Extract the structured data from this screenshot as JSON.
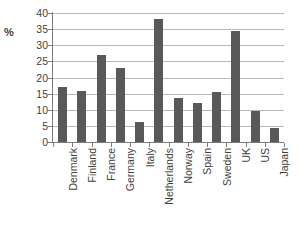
{
  "chart_data": {
    "type": "bar",
    "title": "",
    "subtitle": "",
    "xlabel": "",
    "ylabel": "%",
    "ylim": [
      0,
      40
    ],
    "yticks": [
      0,
      5,
      10,
      15,
      20,
      25,
      30,
      35,
      40
    ],
    "ytick_labels": [
      "0",
      "5",
      "10",
      "15",
      "20",
      "25",
      "30",
      "35",
      "40"
    ],
    "grid": true,
    "grid_axis": "y",
    "legend": false,
    "legend_position": "none",
    "bar_color": "#595959",
    "gridline_color": "#b8b8b8",
    "axis_color": "#7c7c7c",
    "text_color": "#3f3f3f",
    "xtick_label_rotation": 90,
    "categories": [
      "Denmark",
      "Finland",
      "France",
      "Germany",
      "Italy",
      "Netherlands",
      "Norway",
      "Spain",
      "Sweden",
      "UK",
      "US",
      "Japan"
    ],
    "values": [
      17,
      15.7,
      27,
      22.8,
      6.3,
      38,
      13.5,
      12,
      15.5,
      34.5,
      9.5,
      4.5
    ],
    "series": [
      {
        "name": "",
        "values": [
          17,
          15.7,
          27,
          22.8,
          6.3,
          38,
          13.5,
          12,
          15.5,
          34.5,
          9.5,
          4.5
        ]
      }
    ]
  },
  "axis": {
    "unit_label": "%"
  }
}
